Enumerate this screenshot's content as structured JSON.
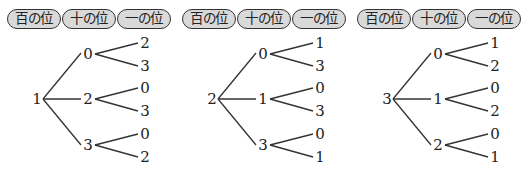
{
  "labels": [
    "百の位",
    "十の位",
    "一の位"
  ],
  "trees": [
    {
      "root": "1",
      "branches": [
        {
          "digit": "0",
          "leaves": [
            "2",
            "3"
          ]
        },
        {
          "digit": "2",
          "leaves": [
            "0",
            "3"
          ]
        },
        {
          "digit": "3",
          "leaves": [
            "0",
            "2"
          ]
        }
      ]
    },
    {
      "root": "2",
      "branches": [
        {
          "digit": "0",
          "leaves": [
            "1",
            "3"
          ]
        },
        {
          "digit": "1",
          "leaves": [
            "0",
            "3"
          ]
        },
        {
          "digit": "3",
          "leaves": [
            "0",
            "1"
          ]
        }
      ]
    },
    {
      "root": "3",
      "branches": [
        {
          "digit": "0",
          "leaves": [
            "1",
            "2"
          ]
        },
        {
          "digit": "1",
          "leaves": [
            "0",
            "2"
          ]
        },
        {
          "digit": "2",
          "leaves": [
            "0",
            "1"
          ]
        }
      ]
    }
  ],
  "colors": {
    "line": "#333333",
    "pill_fill": "#d9d9d9",
    "text": "#222222"
  }
}
